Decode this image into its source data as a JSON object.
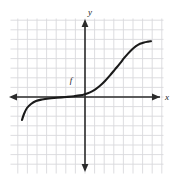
{
  "figure": {
    "background_color": "#ffffff",
    "grid_color": "#d9d9dc",
    "axis_color": "#2b2b2b",
    "curve_color": "#1a1a1a",
    "x_axis_label": "x",
    "y_axis_label": "y",
    "curve_label": "f"
  },
  "chart_data": {
    "type": "line",
    "title": "",
    "xlabel": "x",
    "ylabel": "y",
    "grid": true,
    "legend": null,
    "annotations": [
      {
        "text": "f",
        "x": -1.4,
        "y": 1.9
      }
    ],
    "axis": {
      "x_zero_px": 85,
      "y_zero_px": 97,
      "cell_px": 9.6,
      "xlim": [
        -7.8,
        8.1
      ],
      "ylim": [
        -7.9,
        8.2
      ],
      "x_ticks_visible": false,
      "y_ticks_visible": false
    },
    "series": [
      {
        "name": "f",
        "comment": "Smooth increasing S-shaped curve: steep rise at left end, long flat plateau just below the x-axis, gentle rise through the origin region, second steep rise, then flattening at the right.",
        "points_px": [
          [
            22,
            120
          ],
          [
            24,
            114
          ],
          [
            27,
            108
          ],
          [
            31,
            104
          ],
          [
            36,
            101
          ],
          [
            42,
            99.5
          ],
          [
            49,
            98.5
          ],
          [
            57,
            97.8
          ],
          [
            66,
            97.0
          ],
          [
            74,
            96.2
          ],
          [
            80,
            95.4
          ],
          [
            85,
            94.2
          ],
          [
            90,
            92.4
          ],
          [
            95,
            89.6
          ],
          [
            100,
            85.8
          ],
          [
            105,
            81.0
          ],
          [
            110,
            75.4
          ],
          [
            115,
            69.4
          ],
          [
            120,
            63.4
          ],
          [
            124,
            58.2
          ],
          [
            128,
            53.6
          ],
          [
            132,
            49.6
          ],
          [
            136,
            46.2
          ],
          [
            140,
            43.8
          ],
          [
            144,
            42.4
          ],
          [
            148,
            41.6
          ],
          [
            151,
            41.2
          ]
        ],
        "points_data": [
          [
            -6.56,
            2.4
          ],
          [
            -6.35,
            1.77
          ],
          [
            -6.04,
            1.15
          ],
          [
            -5.63,
            0.73
          ],
          [
            -5.1,
            0.42
          ],
          [
            -4.48,
            0.26
          ],
          [
            -3.75,
            0.16
          ],
          [
            -2.92,
            0.08
          ],
          [
            -1.98,
            0.0
          ],
          [
            -1.15,
            -0.08
          ],
          [
            -0.52,
            -0.17
          ],
          [
            0.0,
            -0.29
          ],
          [
            0.52,
            -0.48
          ],
          [
            1.04,
            -0.77
          ],
          [
            1.56,
            -1.17
          ],
          [
            2.08,
            -1.67
          ],
          [
            2.6,
            -2.25
          ],
          [
            3.13,
            -2.88
          ],
          [
            3.65,
            -3.5
          ],
          [
            4.06,
            -4.04
          ],
          [
            4.48,
            -4.52
          ],
          [
            4.9,
            -4.94
          ],
          [
            5.31,
            -5.29
          ],
          [
            5.73,
            -5.54
          ],
          [
            6.15,
            -5.69
          ],
          [
            6.56,
            -5.77
          ],
          [
            6.88,
            -5.81
          ]
        ]
      }
    ]
  }
}
